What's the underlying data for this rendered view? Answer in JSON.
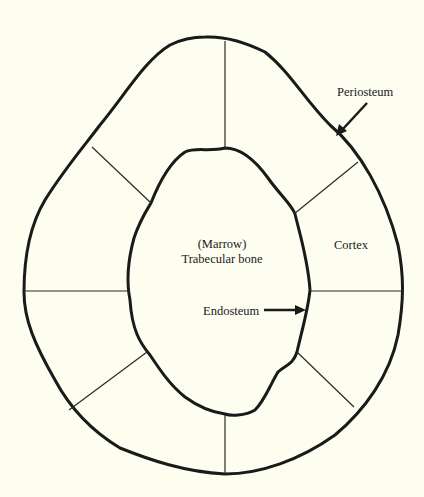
{
  "diagram": {
    "background": "#fdfdf0",
    "stroke_color": "#1a1a1a",
    "labels": {
      "periosteum": "Periosteum",
      "marrow": "(Marrow)",
      "trabecular": "Trabecular bone",
      "cortex": "Cortex",
      "endosteum": "Endosteum"
    },
    "regions": [
      "Periosteum (outer boundary)",
      "Cortex (ring)",
      "Endosteum (inner boundary)",
      "Trabecular bone / Marrow (center)"
    ],
    "radial_divisions": 8
  }
}
